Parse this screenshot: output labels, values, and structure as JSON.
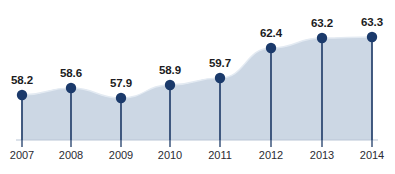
{
  "chart_data": {
    "type": "area",
    "title": "",
    "subtitle": "",
    "xlabel": "",
    "ylabel": "",
    "categories": [
      "2007",
      "2008",
      "2009",
      "2010",
      "2011",
      "2012",
      "2013",
      "2014"
    ],
    "values": [
      58.2,
      58.6,
      57.9,
      58.9,
      59.7,
      62.4,
      63.2,
      63.3
    ],
    "value_labels": [
      "58.2",
      "58.6",
      "57.9",
      "58.9",
      "59.7",
      "62.4",
      "63.2",
      "63.3"
    ],
    "series": [
      {
        "name": "",
        "values": [
          58.2,
          58.6,
          57.9,
          58.9,
          59.7,
          62.4,
          63.2,
          63.3
        ]
      }
    ],
    "ylim": [
      55.8,
      64.2
    ],
    "xlim": [
      "2007",
      "2014"
    ],
    "grid": false,
    "legend": null,
    "legend_position": "none",
    "markers": true,
    "stems": true,
    "annotations": [],
    "colors": {
      "marker": "#1b3a6b",
      "stem": "#2f4a73",
      "area_fill": "#ccd7e4",
      "area_edge": "#e3eaf2",
      "baseline": "#b9c6d6",
      "label_text": "#1c1c22",
      "tick_text": "#2b2b33",
      "background": "#ffffff"
    },
    "geometry": {
      "plot_left": 22,
      "plot_right": 372,
      "baseline_y": 140,
      "axis_label_y": 150,
      "point_x": [
        22,
        71,
        121,
        170,
        220,
        271,
        322,
        372
      ],
      "point_y": [
        95,
        88,
        98,
        85,
        78,
        48,
        38,
        37
      ],
      "marker_radius": 5.2,
      "tick_height": 7
    }
  },
  "ghost": {
    "line1": "",
    "line2": ""
  }
}
